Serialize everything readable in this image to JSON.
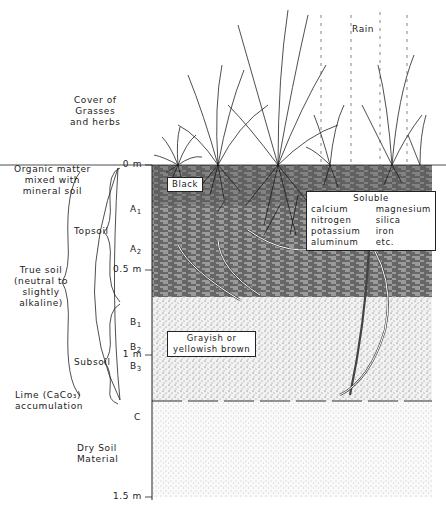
{
  "labels": {
    "cover": [
      "Cover of",
      "Grasses",
      "and herbs"
    ],
    "rain": "Rain",
    "organic": [
      "Organic matter",
      "mixed with",
      "mineral soil"
    ],
    "topsoil": "Topsoil",
    "subsoil": "Subsoil",
    "true_soil": [
      "True soil",
      "(neutral to",
      "slightly",
      "alkaline)"
    ],
    "lime": [
      "Lime (CaCo₃)",
      "accumulation"
    ],
    "dry_soil": [
      "Dry Soil",
      "Material"
    ],
    "black_box": "Black",
    "grayish_box": [
      "Grayish or",
      "yellowish brown"
    ]
  },
  "depth_scale": [
    {
      "label": "0 m",
      "y": 165
    },
    {
      "label": "0.5 m",
      "y": 270
    },
    {
      "label": "1 m",
      "y": 355
    },
    {
      "label": "1.5 m",
      "y": 497
    }
  ],
  "horizons": [
    {
      "name": "A",
      "sub": "1",
      "y": 210
    },
    {
      "name": "A",
      "sub": "2",
      "y": 250
    },
    {
      "name": "B",
      "sub": "1",
      "y": 323
    },
    {
      "name": "B",
      "sub": "2",
      "y": 348
    },
    {
      "name": "B",
      "sub": "3",
      "y": 367
    },
    {
      "name": "C",
      "sub": "",
      "y": 418
    }
  ],
  "soluble": {
    "title": "Soluble",
    "col1": [
      "calcium",
      "nitrogen",
      "potassium",
      "aluminum"
    ],
    "col2": [
      "magnesium",
      "silica",
      "iron",
      "etc."
    ]
  },
  "colors": {
    "ink": "#222222",
    "topsoil_fill": "#6f6f6f",
    "subsoil_fill": "#d9d9d9",
    "c_fill": "#ececec"
  }
}
